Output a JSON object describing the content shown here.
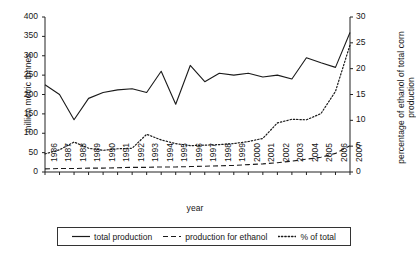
{
  "chart_data": {
    "type": "line",
    "title": "",
    "xlabel": "year",
    "ylabel": "million metric tonnes",
    "y2label": "percentage of ethanol of total corn production",
    "grid": false,
    "legend_position": "bottom",
    "xlim": [
      1986,
      2007
    ],
    "ylim": [
      0,
      400
    ],
    "y2lim": [
      0,
      30
    ],
    "yticks": [
      0,
      50,
      100,
      150,
      200,
      250,
      300,
      350,
      400
    ],
    "y2ticks": [
      0,
      5,
      10,
      15,
      20,
      25,
      30
    ],
    "categories": [
      "1986",
      "1987",
      "1988",
      "1989",
      "1990",
      "1991",
      "1992",
      "1993",
      "1994",
      "1995",
      "1996",
      "1997",
      "1998",
      "1999",
      "2000",
      "2001",
      "2002",
      "2003",
      "2004",
      "2005",
      "2006",
      "2007"
    ],
    "series": [
      {
        "name": "total production",
        "style": "solid",
        "axis": "left",
        "units": "million metric tonnes",
        "values": [
          225,
          200,
          135,
          190,
          205,
          212,
          215,
          205,
          260,
          175,
          275,
          233,
          255,
          250,
          255,
          245,
          250,
          240,
          295,
          282,
          270,
          360
        ]
      },
      {
        "name": "production for ethanol",
        "style": "dashed",
        "axis": "left",
        "units": "million metric tonnes",
        "values": [
          8,
          9,
          9,
          10,
          10,
          11,
          12,
          12,
          13,
          13,
          14,
          15,
          16,
          17,
          19,
          21,
          24,
          28,
          33,
          38,
          48,
          68
        ]
      },
      {
        "name": "% of total",
        "style": "dotted",
        "axis": "right",
        "units": "percent",
        "values": [
          3.5,
          4.3,
          5.8,
          4.6,
          4.2,
          4.5,
          4.6,
          7.3,
          6.2,
          5.5,
          5.1,
          5.2,
          5.3,
          5.5,
          5.9,
          6.5,
          9.5,
          10.2,
          10.1,
          11.3,
          15.6,
          24.6
        ]
      }
    ],
    "legend": [
      {
        "label": "total production",
        "style": "solid"
      },
      {
        "label": "production for ethanol",
        "style": "dashed"
      },
      {
        "label": "% of total",
        "style": "dotted"
      }
    ]
  }
}
